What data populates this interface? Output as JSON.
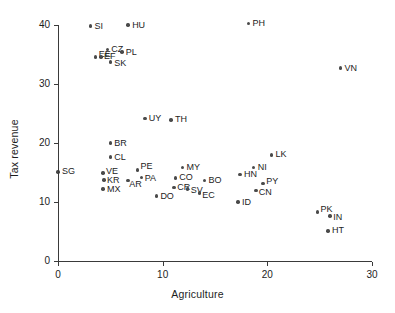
{
  "chart_data": {
    "type": "scatter",
    "title": "",
    "xlabel": "Agriculture",
    "ylabel": "Tax revenue",
    "xlim": [
      0,
      30
    ],
    "ylim": [
      0,
      40
    ],
    "xticks": [
      0,
      10,
      20,
      30
    ],
    "yticks": [
      0,
      10,
      20,
      30,
      40
    ],
    "xtick_labels": [
      "0",
      "10",
      "20",
      "30"
    ],
    "ytick_labels": [
      "0",
      "10",
      "20",
      "30",
      "40"
    ],
    "grid": false,
    "legend": null,
    "marker_color": "#4a4a4a",
    "axis_color": "#3a3a3a",
    "points": [
      {
        "label": "SG",
        "x": 0.0,
        "y": 15.1
      },
      {
        "label": "SI",
        "x": 3.1,
        "y": 39.8
      },
      {
        "label": "HU",
        "x": 6.7,
        "y": 40.0
      },
      {
        "label": "CZ",
        "x": 4.7,
        "y": 35.9
      },
      {
        "label": "PL",
        "x": 6.1,
        "y": 35.4
      },
      {
        "label": "EE",
        "x": 3.6,
        "y": 34.6
      },
      {
        "label": "EF",
        "x": 4.1,
        "y": 34.6
      },
      {
        "label": "SK",
        "x": 5.0,
        "y": 33.7
      },
      {
        "label": "PH",
        "x": 18.2,
        "y": 40.3
      },
      {
        "label": "VN",
        "x": 27.0,
        "y": 32.7
      },
      {
        "label": "UY",
        "x": 8.3,
        "y": 24.2
      },
      {
        "label": "TH",
        "x": 10.8,
        "y": 23.9
      },
      {
        "label": "BR",
        "x": 5.0,
        "y": 20.0
      },
      {
        "label": "CL",
        "x": 5.0,
        "y": 17.6
      },
      {
        "label": "LK",
        "x": 20.4,
        "y": 18.0
      },
      {
        "label": "MY",
        "x": 11.9,
        "y": 15.9
      },
      {
        "label": "NI",
        "x": 18.7,
        "y": 15.8
      },
      {
        "label": "PE",
        "x": 7.6,
        "y": 15.4
      },
      {
        "label": "VE",
        "x": 4.3,
        "y": 14.9
      },
      {
        "label": "HN",
        "x": 17.4,
        "y": 14.7
      },
      {
        "label": "PA",
        "x": 8.0,
        "y": 14.2
      },
      {
        "label": "CO",
        "x": 11.2,
        "y": 14.1
      },
      {
        "label": "KR",
        "x": 4.4,
        "y": 13.7
      },
      {
        "label": "AR",
        "x": 6.7,
        "y": 13.6
      },
      {
        "label": "BO",
        "x": 14.0,
        "y": 13.6
      },
      {
        "label": "PY",
        "x": 19.6,
        "y": 13.1
      },
      {
        "label": "CR",
        "x": 11.1,
        "y": 12.5
      },
      {
        "label": "MX",
        "x": 4.3,
        "y": 12.2
      },
      {
        "label": "SV",
        "x": 12.4,
        "y": 12.2
      },
      {
        "label": "CN",
        "x": 18.9,
        "y": 11.9
      },
      {
        "label": "EC",
        "x": 13.5,
        "y": 11.5
      },
      {
        "label": "DO",
        "x": 9.4,
        "y": 11.0
      },
      {
        "label": "ID",
        "x": 17.2,
        "y": 10.0
      },
      {
        "label": "PK",
        "x": 24.8,
        "y": 8.3
      },
      {
        "label": "IN",
        "x": 26.0,
        "y": 7.6
      },
      {
        "label": "HT",
        "x": 25.8,
        "y": 5.1
      }
    ],
    "label_offsets": {
      "CZ": {
        "dx": 4,
        "dy": -4.5
      },
      "PL": {
        "dx": 4,
        "dy": -4.5
      },
      "EE": {
        "dx": 3,
        "dy": -7
      },
      "EF": {
        "dx": 3,
        "dy": -4.5
      },
      "SK": {
        "dx": 4,
        "dy": -3
      },
      "PE": {
        "dx": 3,
        "dy": -8
      },
      "PA": {
        "dx": 3,
        "dy": -3
      },
      "AR": {
        "dx": 1,
        "dy": -1
      },
      "KR": {
        "dx": 3,
        "dy": -4
      },
      "MX": {
        "dx": 4,
        "dy": -4
      },
      "VE": {
        "dx": 3,
        "dy": -6
      },
      "CR": {
        "dx": 3,
        "dy": -4.5
      },
      "SV": {
        "dx": 3,
        "dy": -3.5
      },
      "EC": {
        "dx": 3,
        "dy": -2.5
      },
      "PY": {
        "dx": 3,
        "dy": -6.5
      },
      "CN": {
        "dx": 3,
        "dy": -3
      },
      "PK": {
        "dx": 3,
        "dy": -7
      },
      "IN": {
        "dx": 3,
        "dy": -3
      },
      "HT": {
        "dx": 4,
        "dy": -4.5
      }
    }
  }
}
